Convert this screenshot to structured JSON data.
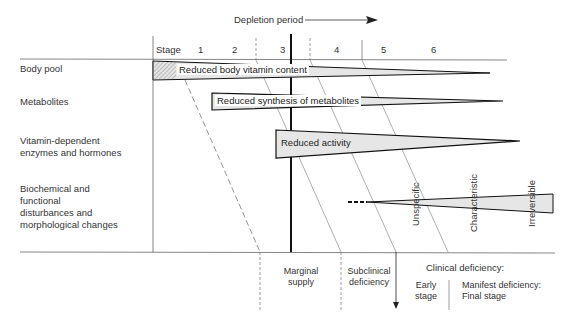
{
  "header": {
    "depletion_label": "Depletion period"
  },
  "stages": {
    "label": "Stage",
    "items": [
      "1",
      "2",
      "3",
      "4",
      "5",
      "6"
    ]
  },
  "rows": [
    {
      "label": "Body pool",
      "bar_label": "Reduced body vitamin content"
    },
    {
      "label": "Metabolites",
      "bar_label": "Reduced synthesis of metabolites"
    },
    {
      "label": "Vitamin-dependent enzymes and hormones",
      "bar_label": "Reduced activity"
    },
    {
      "label": "Biochemical and functional disturbances and morphological changes",
      "bar_label": ""
    }
  ],
  "row_label_lines": {
    "enzymes": [
      "Vitamin-dependent",
      "enzymes and hormones"
    ],
    "biochem": [
      "Biochemical and",
      "functional",
      "disturbances and",
      "morphological changes"
    ]
  },
  "disturbance_labels": [
    "Unspecific",
    "Characteristic",
    "Irreversible"
  ],
  "bottom": {
    "marginal": [
      "Marginal",
      "supply"
    ],
    "subclinical": [
      "Subclinical",
      "deficiency"
    ],
    "clinical": "Clinical deficiency:",
    "early": [
      "Early",
      "stage"
    ],
    "manifest": [
      "Manifest deficiency:",
      "Final stage"
    ]
  }
}
